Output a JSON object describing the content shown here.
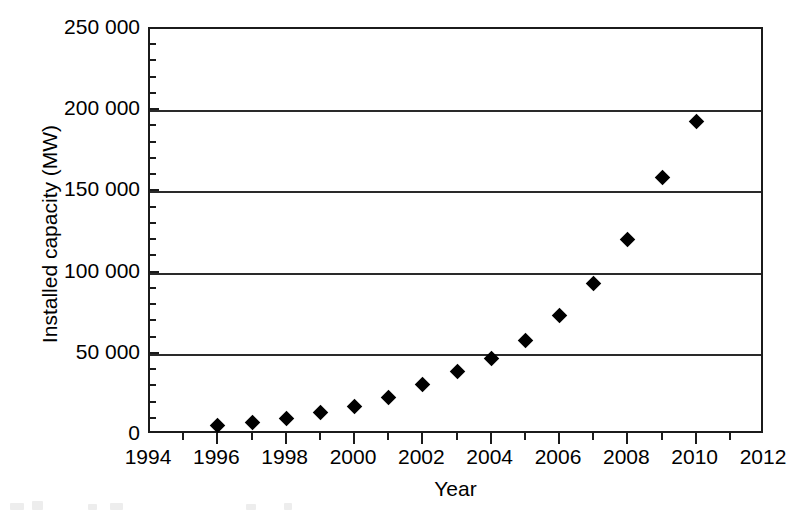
{
  "chart_data": {
    "type": "scatter",
    "title": "",
    "xlabel": "Year",
    "ylabel": "Installed capacity (MW)",
    "xlim": [
      1994,
      2012
    ],
    "ylim": [
      0,
      250000
    ],
    "grid": "horizontal-major-only",
    "legend": "none",
    "marker": "filled-diamond",
    "marker_color": "#000000",
    "x_tick_labels": [
      "1994",
      "1996",
      "1998",
      "2000",
      "2002",
      "2004",
      "2006",
      "2008",
      "2010",
      "2012"
    ],
    "x_tick_values": [
      1994,
      1996,
      1998,
      2000,
      2002,
      2004,
      2006,
      2008,
      2010,
      2012
    ],
    "x_minor_tick_values": [
      1995,
      1997,
      1999,
      2001,
      2003,
      2005,
      2007,
      2009,
      2011
    ],
    "y_tick_labels": [
      "0",
      "50 000",
      "100 000",
      "150 000",
      "200 000",
      "250 000"
    ],
    "y_tick_values": [
      0,
      50000,
      100000,
      150000,
      200000,
      250000
    ],
    "y_minor_tick_interval": 10000,
    "x": [
      1996,
      1997,
      1998,
      1999,
      2000,
      2001,
      2002,
      2003,
      2004,
      2005,
      2006,
      2007,
      2008,
      2009,
      2010
    ],
    "values": [
      5500,
      7500,
      10000,
      13500,
      17000,
      23000,
      31000,
      39000,
      47000,
      58000,
      73000,
      93000,
      120000,
      158000,
      193000
    ],
    "series": [
      {
        "name": "Installed capacity",
        "points": [
          {
            "x": 1996,
            "y": 5500
          },
          {
            "x": 1997,
            "y": 7500
          },
          {
            "x": 1998,
            "y": 10000
          },
          {
            "x": 1999,
            "y": 13500
          },
          {
            "x": 2000,
            "y": 17000
          },
          {
            "x": 2001,
            "y": 23000
          },
          {
            "x": 2002,
            "y": 31000
          },
          {
            "x": 2003,
            "y": 39000
          },
          {
            "x": 2004,
            "y": 47000
          },
          {
            "x": 2005,
            "y": 58000
          },
          {
            "x": 2006,
            "y": 73000
          },
          {
            "x": 2007,
            "y": 93000
          },
          {
            "x": 2008,
            "y": 120000
          },
          {
            "x": 2009,
            "y": 158000
          },
          {
            "x": 2010,
            "y": 193000
          }
        ]
      }
    ]
  }
}
